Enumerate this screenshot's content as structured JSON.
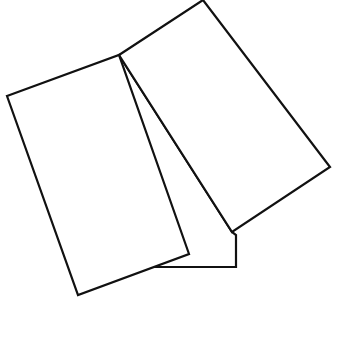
{
  "canvas": {
    "width": 338,
    "height": 352,
    "background": "#ffffff"
  },
  "stroke": {
    "color": "#111111",
    "width": 2.2
  },
  "shapes": {
    "back_rect": {
      "points": "119,55 232,232 236,235 236,267 155,267"
    },
    "left_rect": {
      "points": "7,96 119,55 189,254 78,295"
    },
    "right_rect": {
      "points": "119,55 203,0 330,167 232,232"
    }
  }
}
